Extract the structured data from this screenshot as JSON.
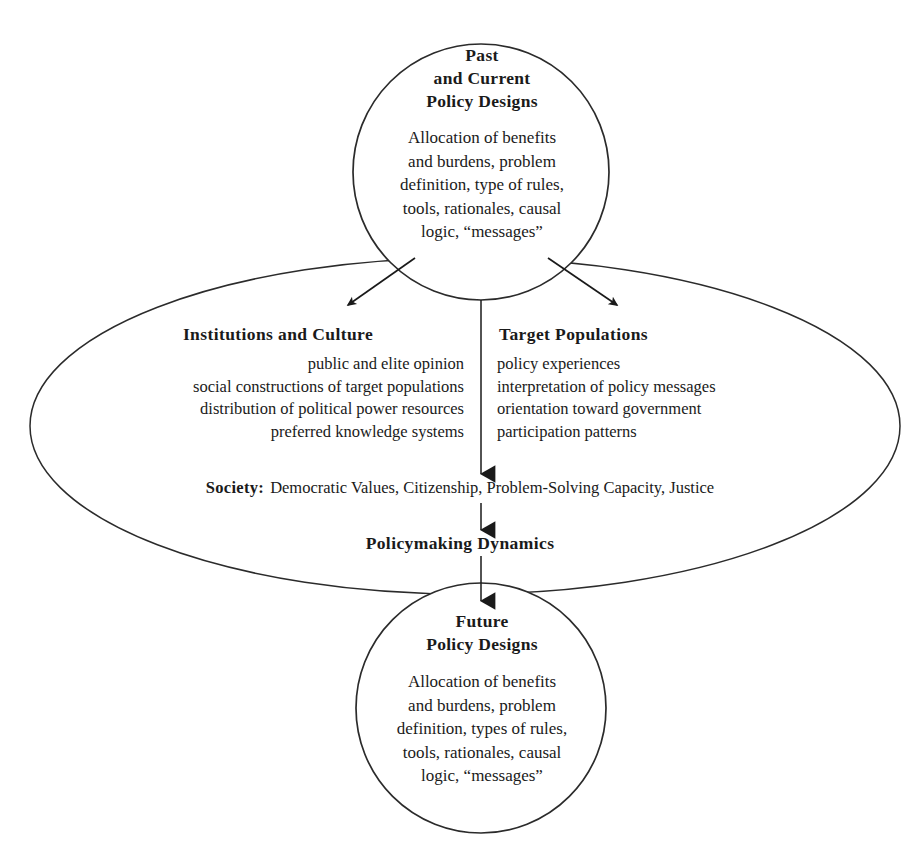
{
  "diagram": {
    "stroke_color": "#2b2b2b",
    "fill_color": "#ffffff",
    "text_color": "#1a1a1a",
    "top_node": {
      "title_lines": [
        "Past",
        "and  Current",
        "Policy  Designs"
      ],
      "body_lines": [
        "Allocation of benefits",
        "and burdens, problem",
        "definition, type of rules,",
        "tools, rationales, causal",
        "logic, “messages”"
      ]
    },
    "bottom_node": {
      "title_lines": [
        "Future",
        "Policy  Designs"
      ],
      "body_lines": [
        "Allocation of benefits",
        "and burdens, problem",
        "definition, types of rules,",
        "tools, rationales, causal",
        "logic, “messages”"
      ]
    },
    "left_column": {
      "heading": "Institutions and Culture",
      "items": [
        "public and elite opinion",
        "social constructions of target populations",
        "distribution of political power resources",
        "preferred knowledge systems"
      ]
    },
    "right_column": {
      "heading": "Target Populations",
      "items": [
        "policy experiences",
        "interpretation of policy messages",
        "orientation toward government",
        "participation patterns"
      ]
    },
    "society": {
      "label": "Society:",
      "value": "Democratic Values, Citizenship, Problem-Solving Capacity, Justice"
    },
    "dynamics": {
      "label": "Policymaking  Dynamics"
    }
  }
}
